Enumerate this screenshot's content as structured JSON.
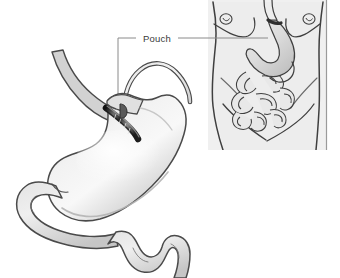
{
  "figure": {
    "kind": "medical-illustration",
    "background_color": "#ffffff",
    "width": 340,
    "height": 278
  },
  "labels": [
    {
      "id": "pouch",
      "text": "Pouch",
      "text_color": "#3a3a3a",
      "leader_color": "#8a8a8a"
    }
  ],
  "main_illustration": {
    "name": "banded-stomach-cutaway",
    "parts": [
      {
        "id": "esophagus",
        "label": "Esophagus"
      },
      {
        "id": "pouch",
        "label": "Pouch"
      },
      {
        "id": "gastric-band",
        "label": "Gastric band"
      },
      {
        "id": "band-tubing",
        "label": "Band tubing"
      },
      {
        "id": "stomach-body",
        "label": "Stomach"
      },
      {
        "id": "duodenum",
        "label": "Duodenum"
      },
      {
        "id": "small-intestine",
        "label": "Small intestine"
      }
    ],
    "colors": {
      "organ_fill": "#cfcfcf",
      "organ_fill_light": "#e6e6e6",
      "organ_highlight": "#f6f6f6",
      "outline": "#4a4a4a",
      "band_dark": "#2e2e2e",
      "band_mid": "#6f6f6f",
      "tube_outline": "#555555",
      "tube_fill": "#d8d8d8"
    }
  },
  "inset_panel": {
    "name": "torso-overview",
    "background_color": "#f0f0f0",
    "border_color": "#9a9a9a",
    "parts": [
      {
        "id": "torso",
        "label": "Torso"
      },
      {
        "id": "breasts",
        "label": "Chest"
      },
      {
        "id": "navel",
        "label": "Navel"
      },
      {
        "id": "stomach",
        "label": "Stomach"
      },
      {
        "id": "gastric-band",
        "label": "Gastric band"
      },
      {
        "id": "band-tubing",
        "label": "Band tubing"
      },
      {
        "id": "small-intestine",
        "label": "Small intestine"
      },
      {
        "id": "rib-margin",
        "label": "Rib margin"
      }
    ],
    "colors": {
      "skin_fill": "#ededed",
      "organ_fill": "#d4d4d4",
      "organ_fill_light": "#e8e8e8",
      "outline": "#3f3f3f",
      "soft_outline": "#6a6a6a",
      "band_dark": "#2e2e2e"
    }
  }
}
